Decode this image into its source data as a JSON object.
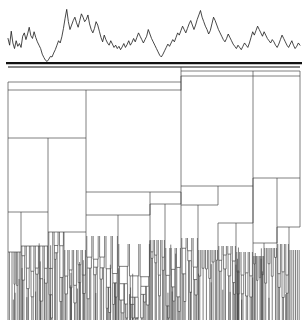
{
  "figure": {
    "title": "",
    "background_color": "#ffffff",
    "width": 308,
    "height": 324,
    "line_color": "#3a3a3a",
    "signal_color": "#1a1a1a",
    "baseline_color": "#111111"
  },
  "signal_panel": {
    "name": "signal-trace",
    "type": "line",
    "x_start": 8,
    "x_end": 300,
    "top": 6,
    "baseline_y": 62,
    "axis_visible": false,
    "tick_labels": [],
    "values": [
      0.42,
      0.3,
      0.55,
      0.34,
      0.24,
      0.38,
      0.28,
      0.33,
      0.26,
      0.46,
      0.52,
      0.4,
      0.5,
      0.62,
      0.47,
      0.42,
      0.54,
      0.44,
      0.36,
      0.3,
      0.24,
      0.14,
      0.08,
      0.03,
      0.01,
      0.05,
      0.1,
      0.09,
      0.16,
      0.22,
      0.3,
      0.38,
      0.34,
      0.45,
      0.6,
      0.78,
      0.94,
      0.72,
      0.58,
      0.66,
      0.74,
      0.8,
      0.7,
      0.62,
      0.74,
      0.86,
      0.8,
      0.72,
      0.76,
      0.84,
      0.68,
      0.58,
      0.52,
      0.6,
      0.72,
      0.66,
      0.55,
      0.44,
      0.36,
      0.48,
      0.4,
      0.34,
      0.3,
      0.38,
      0.32,
      0.26,
      0.3,
      0.24,
      0.28,
      0.22,
      0.27,
      0.33,
      0.26,
      0.31,
      0.38,
      0.3,
      0.35,
      0.42,
      0.36,
      0.44,
      0.52,
      0.46,
      0.4,
      0.34,
      0.4,
      0.46,
      0.58,
      0.5,
      0.42,
      0.36,
      0.3,
      0.24,
      0.18,
      0.12,
      0.09,
      0.14,
      0.2,
      0.26,
      0.32,
      0.28,
      0.34,
      0.4,
      0.36,
      0.44,
      0.52,
      0.48,
      0.56,
      0.64,
      0.58,
      0.52,
      0.6,
      0.68,
      0.74,
      0.66,
      0.58,
      0.66,
      0.76,
      0.84,
      0.92,
      0.8,
      0.72,
      0.64,
      0.58,
      0.5,
      0.56,
      0.68,
      0.8,
      0.74,
      0.66,
      0.58,
      0.52,
      0.46,
      0.4,
      0.36,
      0.42,
      0.5,
      0.44,
      0.38,
      0.32,
      0.28,
      0.24,
      0.3,
      0.26,
      0.22,
      0.28,
      0.34,
      0.3,
      0.26,
      0.34,
      0.44,
      0.54,
      0.48,
      0.56,
      0.64,
      0.58,
      0.52,
      0.46,
      0.54,
      0.48,
      0.42,
      0.38,
      0.34,
      0.4,
      0.36,
      0.3,
      0.26,
      0.32,
      0.4,
      0.48,
      0.42,
      0.36,
      0.3,
      0.26,
      0.32,
      0.38,
      0.3,
      0.24,
      0.28,
      0.34,
      0.3
    ],
    "y_min": 0,
    "y_max": 1
  },
  "dendrogram": {
    "name": "hierarchical-clustering-dendrogram",
    "type": "dendrogram",
    "orientation": "top-down",
    "x_start": 8,
    "x_end": 300,
    "top_y": 66,
    "bottom_y": 320,
    "leaf_count": 160,
    "root_height": 1.0,
    "axis_visible": false,
    "tick_labels": [],
    "merges": [
      {
        "id": "m-root",
        "left": 8,
        "right": 300,
        "split": 181,
        "y": 67,
        "level": 0
      },
      {
        "id": "m-L0",
        "left": 8,
        "right": 181,
        "split": 86,
        "y": 82,
        "level": 1
      },
      {
        "id": "m-L1",
        "left": 8,
        "right": 181,
        "split": 86,
        "y": 90,
        "level": 2
      },
      {
        "id": "m-R0",
        "left": 181,
        "right": 300,
        "split": 253,
        "y": 71,
        "level": 1
      },
      {
        "id": "m-R1",
        "left": 181,
        "right": 300,
        "split": 253,
        "y": 76,
        "level": 2
      },
      {
        "id": "m-LA",
        "left": 8,
        "right": 86,
        "split": 48,
        "y": 138,
        "level": 3
      },
      {
        "id": "m-LAa",
        "left": 8,
        "right": 48,
        "split": 21,
        "y": 212,
        "level": 4
      },
      {
        "id": "m-LAa1",
        "left": 8,
        "right": 21,
        "split": 13,
        "y": 252,
        "level": 5
      },
      {
        "id": "m-LAa2",
        "left": 21,
        "right": 48,
        "split": 32,
        "y": 246,
        "level": 5
      },
      {
        "id": "m-LAb",
        "left": 48,
        "right": 86,
        "split": 64,
        "y": 232,
        "level": 4
      },
      {
        "id": "m-LB",
        "left": 86,
        "right": 181,
        "split": 150,
        "y": 192,
        "level": 3
      },
      {
        "id": "m-LBa",
        "left": 86,
        "right": 150,
        "split": 118,
        "y": 215,
        "level": 4
      },
      {
        "id": "m-LBb",
        "left": 150,
        "right": 181,
        "split": 165,
        "y": 204,
        "level": 4
      },
      {
        "id": "m-RA",
        "left": 181,
        "right": 253,
        "split": 218,
        "y": 186,
        "level": 3
      },
      {
        "id": "m-RAa",
        "left": 181,
        "right": 218,
        "split": 198,
        "y": 205,
        "level": 4
      },
      {
        "id": "m-RAb",
        "left": 218,
        "right": 253,
        "split": 236,
        "y": 223,
        "level": 4
      },
      {
        "id": "m-RB",
        "left": 253,
        "right": 300,
        "split": 277,
        "y": 178,
        "level": 3
      },
      {
        "id": "m-RBa",
        "left": 253,
        "right": 277,
        "split": 264,
        "y": 243,
        "level": 4
      },
      {
        "id": "m-RBb",
        "left": 277,
        "right": 300,
        "split": 289,
        "y": 227,
        "level": 4
      }
    ],
    "leaf_heights_note": "terminal branch depths extend to the chart bottom"
  },
  "labels": {
    "x_axis": "",
    "y_axis": "",
    "legend": []
  }
}
